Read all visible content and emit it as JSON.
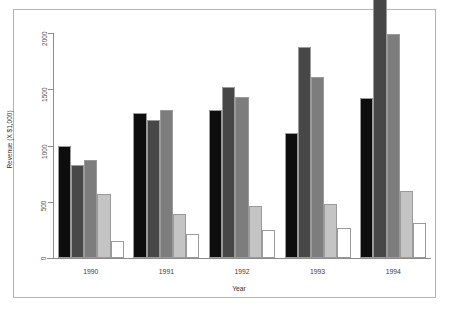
{
  "chart_data": {
    "type": "bar",
    "title": "",
    "xlabel": "Year",
    "ylabel": "Revenue (X $1,000)",
    "categories": [
      "1990",
      "1991",
      "1992",
      "1993",
      "1994"
    ],
    "ylim": [
      0,
      2000
    ],
    "yticks": [
      0,
      500,
      1000,
      1500,
      2000
    ],
    "ytick_labels": [
      "0",
      "500",
      "1000",
      "1500",
      "2000"
    ],
    "grid": false,
    "legend": "none",
    "series": [
      {
        "name": "Series 1",
        "color": "#0d0d0d",
        "values": [
          1000,
          1285,
          1320,
          1110,
          1420
        ]
      },
      {
        "name": "Series 2",
        "color": "#474747",
        "values": [
          830,
          1225,
          1520,
          1880,
          2320
        ]
      },
      {
        "name": "Series 3",
        "color": "#7d7d7d",
        "values": [
          870,
          1320,
          1430,
          1610,
          1990
        ]
      },
      {
        "name": "Series 4",
        "color": "#c4c4c4",
        "values": [
          570,
          390,
          465,
          480,
          600
        ]
      },
      {
        "name": "Series 5",
        "color": "#ffffff",
        "values": [
          155,
          215,
          250,
          270,
          310
        ]
      }
    ]
  },
  "axis": {
    "y_title": "Revenue (X $1,000)",
    "x_title": "Year"
  }
}
